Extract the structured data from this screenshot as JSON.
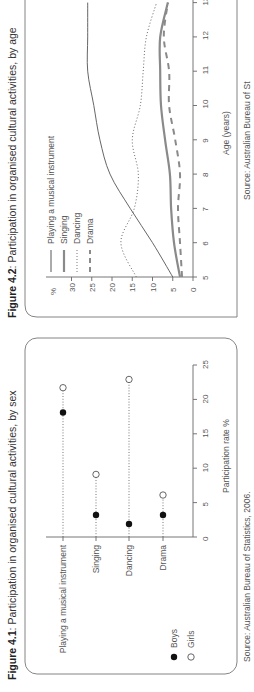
{
  "figures": {
    "fig42": {
      "label": "Figure 4.2",
      "caption": ": Participation in organised cultural activities, by age",
      "source": "Source: Australian Bureau of St",
      "y_unit": "%",
      "xlabel": "Age (years)",
      "legend": [
        "Playing a musical instrument",
        "Singing",
        "Dancing",
        "Drama"
      ]
    },
    "fig41": {
      "label": "Figure 4.1",
      "caption": ": Participation in organised cultural activities, by sex",
      "source": "Source: Australian Bureau of Statistics, 2006.",
      "xlabel": "Participation rate %",
      "legend": [
        "Boys",
        "Girls"
      ]
    }
  },
  "chart_data": [
    {
      "type": "line",
      "title": "Figure 4.2: Participation in organised cultural activities, by age",
      "xlabel": "Age (years)",
      "ylabel": "%",
      "x": [
        5,
        6,
        7,
        8,
        9,
        10,
        11,
        12,
        13
      ],
      "xlim": [
        5,
        13
      ],
      "ylim": [
        0,
        30
      ],
      "yticks": [
        0,
        5,
        10,
        15,
        20,
        25,
        30
      ],
      "grid": false,
      "legend_position": "top-left",
      "series": [
        {
          "name": "Playing a musical instrument",
          "style": "thin-solid",
          "values": [
            5,
            10,
            15.5,
            20.5,
            23,
            24.5,
            26,
            26,
            26
          ]
        },
        {
          "name": "Singing",
          "style": "thick-solid",
          "values": [
            3.2,
            4.7,
            5.4,
            5.7,
            6.9,
            7.9,
            8.1,
            8.1,
            6.2
          ]
        },
        {
          "name": "Dancing",
          "style": "dotted",
          "values": [
            14,
            17.8,
            14.5,
            13.5,
            15,
            13,
            12.3,
            11.5,
            9
          ]
        },
        {
          "name": "Drama",
          "style": "dashed",
          "values": [
            2.7,
            3.2,
            3.7,
            3.2,
            4.4,
            5.9,
            5.9,
            7.2,
            6.2
          ]
        }
      ],
      "source": "Source: Australian Bureau of Statistics"
    },
    {
      "type": "scatter",
      "title": "Figure 4.1: Participation in organised cultural activities, by sex",
      "xlabel": "Participation rate %",
      "ylabel": "",
      "categories": [
        "Playing a musical instrument",
        "Singing",
        "Dancing",
        "Drama"
      ],
      "xlim": [
        0,
        25
      ],
      "xticks": [
        0,
        5,
        10,
        15,
        20,
        25
      ],
      "legend_position": "bottom-left",
      "series": [
        {
          "name": "Boys",
          "marker": "filled-circle",
          "values": [
            18.1,
            3.2,
            1.9,
            3.2
          ]
        },
        {
          "name": "Girls",
          "marker": "open-circle",
          "values": [
            21.7,
            9.1,
            22.9,
            6.1
          ]
        }
      ],
      "source": "Source: Australian Bureau of Statistics, 2006."
    }
  ]
}
